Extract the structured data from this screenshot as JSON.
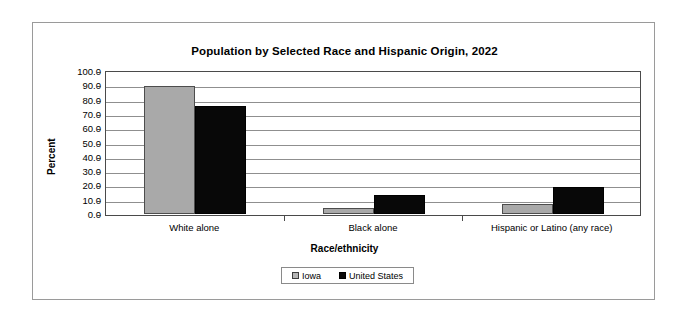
{
  "chart_data": {
    "type": "bar",
    "title": "Population by Selected Race and Hispanic Origin, 2022",
    "xlabel": "Race/ethnicity",
    "ylabel": "Percent",
    "categories": [
      "White alone",
      "Black alone",
      "Hispanic or Latino (any race)"
    ],
    "series": [
      {
        "name": "Iowa",
        "color": "#a9a9a9",
        "values": [
          89.5,
          4.4,
          6.9
        ]
      },
      {
        "name": "United States",
        "color": "#080808",
        "values": [
          75.5,
          13.6,
          19.1
        ]
      }
    ],
    "ylim": [
      0.0,
      100.0
    ],
    "ytick_step": 10.0,
    "ytick_labels": [
      "100.0",
      "90.0",
      "80.0",
      "70.0",
      "60.0",
      "50.0",
      "40.0",
      "30.0",
      "20.0",
      "10.0",
      "0.0"
    ],
    "grid": true,
    "grid_axis": "y",
    "legend_position": "bottom-center",
    "legend_entries": [
      "Iowa",
      "United States"
    ]
  }
}
